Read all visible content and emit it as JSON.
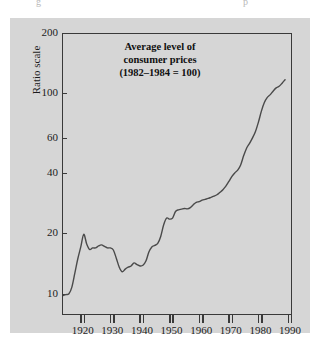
{
  "page": {
    "background_color": "#ffffff",
    "panel_color": "#d6d6d6",
    "ink_color": "#3a3a3a",
    "bleed_text_left": "g",
    "bleed_text_right": "p"
  },
  "figure": {
    "title_line_1": "Average level of",
    "title_line_2": "consumer prices",
    "title_line_3": "(1982–1984 = 100)",
    "y_axis_caption": "Ratio scale"
  },
  "chart_data": {
    "type": "line",
    "title": "Average level of consumer prices (1982–1984 = 100)",
    "subtitle": "",
    "xlabel": "",
    "ylabel": "Ratio scale",
    "yscale": "log",
    "xlim": [
      1913,
      1990
    ],
    "ylim": [
      8,
      200
    ],
    "grid": false,
    "legend": null,
    "y_ticks": [
      200,
      100,
      60,
      40,
      20,
      10
    ],
    "y_tick_labels": [
      "200",
      "100",
      "60",
      "40",
      "20",
      "10"
    ],
    "x_ticks": [
      1920,
      1930,
      1940,
      1950,
      1960,
      1970,
      1980,
      1990
    ],
    "x_tick_labels": [
      "1920",
      "1930",
      "1940",
      "1950",
      "1960",
      "1970",
      "1980",
      "1990"
    ],
    "line_color": "#4a4a4a",
    "line_width": 1.4,
    "series": [
      {
        "name": "Consumer price index (1982–1984 = 100)",
        "x": [
          1913,
          1914,
          1915,
          1916,
          1917,
          1918,
          1919,
          1920,
          1921,
          1922,
          1923,
          1924,
          1925,
          1926,
          1927,
          1928,
          1929,
          1930,
          1931,
          1932,
          1933,
          1934,
          1935,
          1936,
          1937,
          1938,
          1939,
          1940,
          1941,
          1942,
          1943,
          1944,
          1945,
          1946,
          1947,
          1948,
          1949,
          1950,
          1951,
          1952,
          1953,
          1954,
          1955,
          1956,
          1957,
          1958,
          1959,
          1960,
          1961,
          1962,
          1963,
          1964,
          1965,
          1966,
          1967,
          1968,
          1969,
          1970,
          1971,
          1972,
          1973,
          1974,
          1975,
          1976,
          1977,
          1978,
          1979,
          1980,
          1981,
          1982,
          1983,
          1984,
          1985,
          1986,
          1987,
          1988
        ],
        "values": [
          9.9,
          10.0,
          10.1,
          10.9,
          12.8,
          15.1,
          17.3,
          20.0,
          17.9,
          16.8,
          17.1,
          17.1,
          17.5,
          17.7,
          17.4,
          17.1,
          17.1,
          16.7,
          15.2,
          13.7,
          13.0,
          13.4,
          13.7,
          13.9,
          14.4,
          14.1,
          13.9,
          14.0,
          14.7,
          16.3,
          17.3,
          17.6,
          18.0,
          19.5,
          22.3,
          24.1,
          23.8,
          24.1,
          26.0,
          26.5,
          26.7,
          26.9,
          26.8,
          27.2,
          28.1,
          28.9,
          29.1,
          29.6,
          29.9,
          30.2,
          30.6,
          31.0,
          31.5,
          32.4,
          33.4,
          34.8,
          36.7,
          38.8,
          40.5,
          41.8,
          44.4,
          49.3,
          53.8,
          56.9,
          60.6,
          65.2,
          72.6,
          82.4,
          90.9,
          96.5,
          99.6,
          103.9,
          107.6,
          109.6,
          113.6,
          118.3
        ]
      }
    ],
    "annotations": [
      {
        "text": "Average level of consumer prices (1982–1984 = 100)",
        "position": "inside-top-center"
      }
    ]
  }
}
